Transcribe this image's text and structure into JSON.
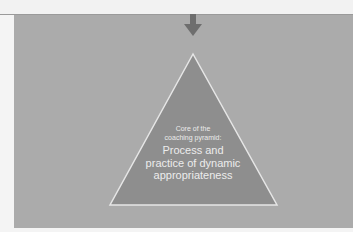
{
  "diagram": {
    "subtitle_line1": "Core of the",
    "subtitle_line2": "coaching pyramid:",
    "title_line1": "Process and",
    "title_line2": "practice of dynamic",
    "title_line3": "appropriateness",
    "colors": {
      "panel": "#ababab",
      "triangle_fill": "#8e8e8e",
      "triangle_stroke": "#e6e6e6",
      "arrow": "#6e6e6e",
      "text": "#ececec"
    }
  }
}
